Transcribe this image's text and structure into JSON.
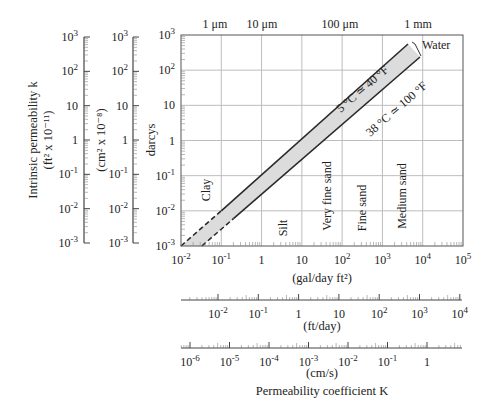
{
  "chart_data": {
    "type": "line",
    "title": "",
    "main_plot": {
      "x_axis": {
        "label": "(gal/day ft²)",
        "scale": "log",
        "range": [
          0.01,
          100000
        ],
        "ticks": [
          "10^-2",
          "10^-1",
          "1",
          "10",
          "10^2",
          "10^3",
          "10^4",
          "10^5"
        ]
      },
      "y_axis": {
        "label": "darcys",
        "scale": "log",
        "range": [
          0.001,
          1000
        ],
        "ticks": [
          "10^-3",
          "10^-2",
          "10^-1",
          "1",
          "10",
          "10^2",
          "10^3"
        ]
      },
      "top_axis": {
        "label": "grain size",
        "ticks": [
          {
            "label": "1 μm",
            "x": 0.01
          },
          {
            "label": "10 μm",
            "x": 1
          },
          {
            "label": "100 μm",
            "x": 100
          },
          {
            "label": "1 mm",
            "x": 10000
          }
        ]
      },
      "grid": true,
      "series": [
        {
          "name": "5 °C ≃ 40 °F",
          "x": [
            0.01,
            0.1,
            10000
          ],
          "y": [
            0.001,
            0.01,
            800
          ],
          "dashed_until_x": 0.1
        },
        {
          "name": "38 °C ≃ 100 °F",
          "x": [
            0.033,
            0.2,
            10000
          ],
          "y": [
            0.001,
            0.006,
            300
          ],
          "dashed_until_x": 0.2
        }
      ],
      "band_label": "Water",
      "soil_labels": [
        "Clay",
        "Silt",
        "Very fine sand",
        "Fine sand",
        "Medium sand"
      ]
    },
    "left_axes": [
      {
        "label": "Intrinsic permeability k",
        "unit": "(ft² x 10⁻¹¹)",
        "ticks": [
          "10^-3",
          "10^-2",
          "10^-1",
          "1",
          "10",
          "10^2",
          "10^3"
        ]
      },
      {
        "label": "",
        "unit": "(cm² x 10⁻⁸)",
        "ticks": [
          "10^-3",
          "10^-2",
          "10^-1",
          "1",
          "10",
          "10^2",
          "10^3"
        ]
      }
    ],
    "bottom_axes": [
      {
        "unit": "(ft/day)",
        "ticks": [
          "10^-2",
          "10^-1",
          "1",
          "10",
          "10^2",
          "10^3",
          "10^4"
        ]
      },
      {
        "unit": "(cm/s)",
        "ticks": [
          "10^-6",
          "10^-5",
          "10^-4",
          "10^-3",
          "10^-2",
          "10^-1",
          "1"
        ]
      }
    ],
    "bottom_title": "Permeability coefficient K"
  },
  "labels": {
    "left_title_1": "Intrinsic permeability k",
    "left_unit_1": "(ft² x 10⁻¹¹)",
    "left_unit_2": "(cm² x 10⁻⁸)",
    "darcys": "darcys",
    "gal_unit": "(gal/day ft²)",
    "ftday_unit": "(ft/day)",
    "cms_unit": "(cm/s)",
    "bottom_title": "Permeability coefficient K",
    "water": "Water",
    "line_upper": "5 °C ≃ 40 °F",
    "line_lower": "38 °C ≃ 100 °F",
    "top_1um": "1 μm",
    "top_10um": "10 μm",
    "top_100um": "100 μm",
    "top_1mm": "1 mm",
    "clay": "Clay",
    "silt": "Silt",
    "very_fine_sand": "Very fine sand",
    "fine_sand": "Fine sand",
    "medium_sand": "Medium sand"
  },
  "colors": {
    "line": "#2a2a2a",
    "grid": "#bdbdbd",
    "band_fill": "#dcdcdc",
    "axis": "#444444"
  }
}
